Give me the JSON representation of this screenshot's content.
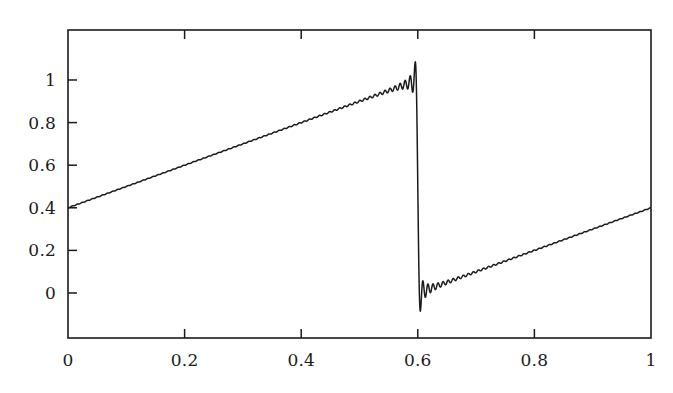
{
  "figure": {
    "name": "gibbs-phenomenon-plot",
    "background_color": "#ffffff",
    "line_color": "#1b1b1b",
    "axis_color": "#1b1b1b",
    "width": 673,
    "height": 393
  },
  "axes": {
    "frame": {
      "left": 68,
      "top": 30,
      "right": 651,
      "bottom": 338
    },
    "tick_direction": "in",
    "tick_length": 9,
    "frame_ticks_on": [
      "left",
      "top",
      "bottom"
    ],
    "x_tick_labels": [
      "0",
      "0.2",
      "0.4",
      "0.6",
      "0.8",
      "1"
    ],
    "x_tick_values": [
      0,
      0.2,
      0.4,
      0.6,
      0.8,
      1
    ],
    "y_tick_labels": [
      "0",
      "0.2",
      "0.4",
      "0.6",
      "0.8",
      "1"
    ],
    "y_tick_values": [
      0,
      0.2,
      0.4,
      0.6,
      0.8,
      1
    ]
  },
  "chart_data": {
    "type": "line",
    "title": "",
    "xlabel": "",
    "ylabel": "",
    "xlim": [
      0,
      1
    ],
    "ylim": [
      -0.2113,
      1.2347
    ],
    "grid": false,
    "legend": null,
    "series": [
      {
        "name": "partial-sum",
        "function": "fourier_partial_sum_step",
        "jump_x": 0.6,
        "level_left": 0.0,
        "level_right": 1.0,
        "n_terms": 115,
        "overshoot_peak_y": 1.145,
        "undershoot_min_y": -0.089,
        "right_plateau_y": 1.02,
        "left_plateau_y": 0.0,
        "samples": 6000
      }
    ]
  }
}
